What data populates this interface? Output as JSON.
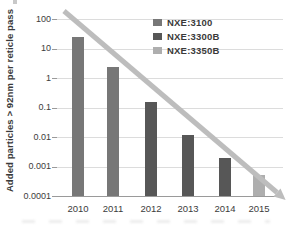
{
  "chart_data": {
    "type": "bar",
    "title": "",
    "xlabel": "",
    "ylabel": "Added particles > 92nm per reticle pass",
    "y_scale": "log",
    "ylim": [
      0.0001,
      100
    ],
    "y_tick_labels": [
      "100",
      "10",
      "1",
      "0.1",
      "0.01",
      "0.001",
      "0.0001"
    ],
    "categories": [
      "2010",
      "2011",
      "2012",
      "2013",
      "2014",
      "2015"
    ],
    "grid": "horizontal",
    "bars": [
      {
        "category": "2010",
        "value": 25,
        "series": "NXE:3100"
      },
      {
        "category": "2011",
        "value": 2.4,
        "series": "NXE:3100"
      },
      {
        "category": "2012",
        "value": 0.15,
        "series": "NXE:3300B"
      },
      {
        "category": "2013",
        "value": 0.012,
        "series": "NXE:3300B"
      },
      {
        "category": "2014",
        "value": 0.002,
        "series": "NXE:3300B"
      },
      {
        "category": "2015",
        "value": 0.0005,
        "series": "NXE:3350B"
      }
    ],
    "series": [
      {
        "name": "NXE:3100",
        "color": "#777777",
        "values": [
          25,
          2.4,
          null,
          null,
          null,
          null
        ]
      },
      {
        "name": "NXE:3300B",
        "color": "#575757",
        "values": [
          null,
          null,
          0.15,
          0.012,
          0.002,
          null
        ]
      },
      {
        "name": "NXE:3350B",
        "color": "#aeaeae",
        "values": [
          null,
          null,
          null,
          null,
          null,
          0.0005
        ]
      }
    ],
    "legend": {
      "position": "top-right",
      "entries": [
        {
          "label": "NXE:3100",
          "color": "#777777"
        },
        {
          "label": "NXE:3300B",
          "color": "#575757"
        },
        {
          "label": "NXE:3350B",
          "color": "#aeaeae"
        }
      ]
    },
    "annotations": [
      {
        "type": "trend-arrow",
        "color": "#bdbdbd",
        "description": "diagonal downward trend line with arrowhead from ~100 at 2010 to ~0.0001 at 2015"
      }
    ],
    "colors": {
      "gridline": "#dcdcdc",
      "axis": "#9a9a9a",
      "text": "#3c3c3c"
    }
  }
}
